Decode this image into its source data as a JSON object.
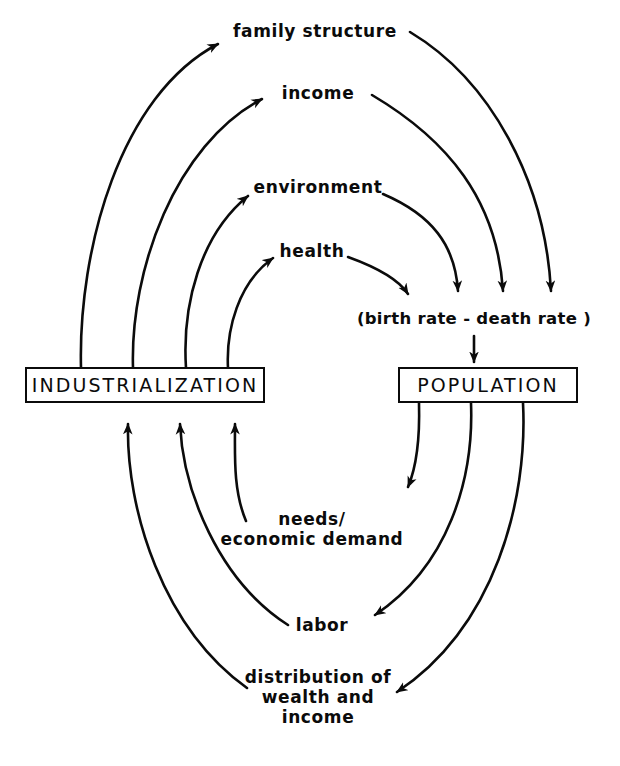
{
  "diagram": {
    "type": "causal-loop-diagram",
    "stroke_color": "#0b0b0b",
    "background_color": "#ffffff",
    "nodes": {
      "industrialization": {
        "label": "INDUSTRIALIZATION",
        "shape": "box"
      },
      "population": {
        "label": "POPULATION",
        "shape": "box"
      },
      "family_structure": {
        "label": "family structure",
        "shape": "text"
      },
      "income": {
        "label": "income",
        "shape": "text"
      },
      "environment": {
        "label": "environment",
        "shape": "text"
      },
      "health": {
        "label": "health",
        "shape": "text"
      },
      "birth_death_rate": {
        "label": "(birth rate - death rate )",
        "shape": "text"
      },
      "needs": {
        "label": "needs/\neconomic demand",
        "shape": "text"
      },
      "labor": {
        "label": "labor",
        "shape": "text"
      },
      "distribution": {
        "label": "distribution of\nwealth and\nincome",
        "shape": "text"
      }
    },
    "edges": [
      {
        "from": "industrialization",
        "to": "family_structure",
        "direction": "up-right",
        "arrowhead": true
      },
      {
        "from": "industrialization",
        "to": "income",
        "direction": "up-right",
        "arrowhead": true
      },
      {
        "from": "industrialization",
        "to": "environment",
        "direction": "up-right",
        "arrowhead": true
      },
      {
        "from": "industrialization",
        "to": "health",
        "direction": "up-right",
        "arrowhead": true
      },
      {
        "from": "family_structure",
        "to": "birth_death_rate",
        "direction": "down-right",
        "arrowhead": true
      },
      {
        "from": "income",
        "to": "birth_death_rate",
        "direction": "down-right",
        "arrowhead": true
      },
      {
        "from": "environment",
        "to": "birth_death_rate",
        "direction": "down-right",
        "arrowhead": true
      },
      {
        "from": "health",
        "to": "birth_death_rate",
        "direction": "down-right",
        "arrowhead": true
      },
      {
        "from": "birth_death_rate",
        "to": "population",
        "direction": "down",
        "arrowhead": true
      },
      {
        "from": "population",
        "to": "needs",
        "direction": "down-left",
        "arrowhead": true
      },
      {
        "from": "population",
        "to": "labor",
        "direction": "down-left",
        "arrowhead": true
      },
      {
        "from": "population",
        "to": "distribution",
        "direction": "down-left",
        "arrowhead": true
      },
      {
        "from": "needs",
        "to": "industrialization",
        "direction": "up-left",
        "arrowhead": true
      },
      {
        "from": "labor",
        "to": "industrialization",
        "direction": "up-left",
        "arrowhead": true
      },
      {
        "from": "distribution",
        "to": "industrialization",
        "direction": "up-left",
        "arrowhead": true
      }
    ]
  }
}
